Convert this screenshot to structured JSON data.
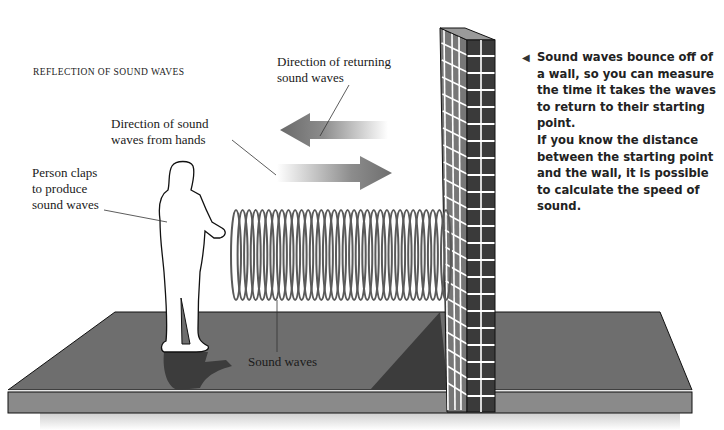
{
  "title": "REFLECTION OF SOUND WAVES",
  "labels": {
    "returning": [
      "Direction of returning",
      "sound waves"
    ],
    "from_hands": [
      "Direction of sound",
      "waves from hands"
    ],
    "person": [
      "Person claps",
      "to produce",
      "sound waves"
    ],
    "sound_waves": "Sound waves"
  },
  "note": {
    "marker": "◀",
    "para1": "Sound waves bounce off of a wall, so you can measure the time it takes the waves to return to their starting point.",
    "para2": "If you know the distance between the starting point and the wall, it is possible to calculate the speed of sound."
  },
  "colors": {
    "floor_top": "#6e6e6e",
    "floor_front": "#8a8a8a",
    "wall_front": "#3a3a3a",
    "wall_side": "#777777",
    "mortar": "#ffffff",
    "coil": "#5a5a5a",
    "arrow": "#707070",
    "shadow": "#3c3c3c"
  },
  "coils": {
    "count": 33,
    "x_start": 236,
    "x_end": 446,
    "y_center": 255,
    "ry": 45,
    "rx": 5
  }
}
